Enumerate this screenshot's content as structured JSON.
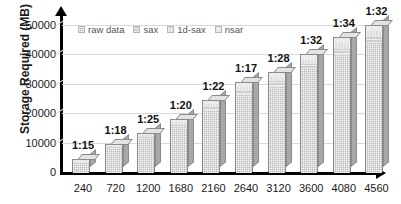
{
  "chart_data": {
    "type": "bar",
    "title": "",
    "subtitle": "",
    "xlabel": "",
    "ylabel": "Storage Required (MB)",
    "categories": [
      "240",
      "720",
      "1200",
      "1680",
      "2160",
      "2640",
      "3120",
      "3600",
      "4080",
      "4560"
    ],
    "ytick_labels": [
      "50000",
      "40000",
      "30000",
      "20000",
      "10000",
      "0"
    ],
    "ylim": [
      0,
      50000
    ],
    "ytick_values": [
      50000,
      40000,
      30000,
      20000,
      10000,
      0
    ],
    "grid": true,
    "legend_position": "top-left",
    "stacked": true,
    "three_d": true,
    "legend": [
      "raw data",
      "sax",
      "1d-sax",
      "nsar"
    ],
    "series": [
      {
        "name": "raw data",
        "values": [
          3800,
          8200,
          11600,
          15500,
          21500,
          26800,
          29600,
          35200,
          40300,
          44200
        ]
      },
      {
        "name": "sax",
        "values": [
          300,
          500,
          700,
          900,
          1100,
          1400,
          1600,
          1800,
          2000,
          2200
        ]
      },
      {
        "name": "1d-sax",
        "values": [
          250,
          450,
          600,
          800,
          1000,
          1200,
          1400,
          1600,
          1800,
          1900
        ]
      },
      {
        "name": "nsar",
        "values": [
          200,
          350,
          500,
          700,
          900,
          1100,
          1300,
          1500,
          1700,
          1800
        ]
      }
    ],
    "totals": [
      4550,
      9500,
      13400,
      17900,
      24500,
      30500,
      33900,
      40100,
      45800,
      50100
    ],
    "annotations": [
      "1:15",
      "1:18",
      "1:25",
      "1:20",
      "1:22",
      "1:17",
      "1:28",
      "1:32",
      "1:34",
      "1:32"
    ]
  },
  "colors": {
    "raw_data": "#b9b9b9",
    "sax": "#cfcfcf",
    "1d_sax": "#dedede",
    "nsar": "#ececec",
    "axis": "#000000",
    "gridline": "#d9d9d9",
    "background": "#ffffff"
  }
}
